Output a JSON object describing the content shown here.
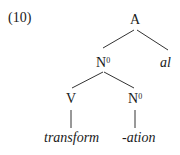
{
  "example_number": "(10)",
  "tree": {
    "root": {
      "label": "A"
    },
    "n0_upper": {
      "label": "N",
      "sup": "0"
    },
    "suffix_al": {
      "label": "al"
    },
    "v": {
      "label": "V"
    },
    "n0_lower": {
      "label": "N",
      "sup": "0"
    },
    "leaf_transform": {
      "label": "transform"
    },
    "leaf_ation": {
      "label": "-ation"
    }
  }
}
